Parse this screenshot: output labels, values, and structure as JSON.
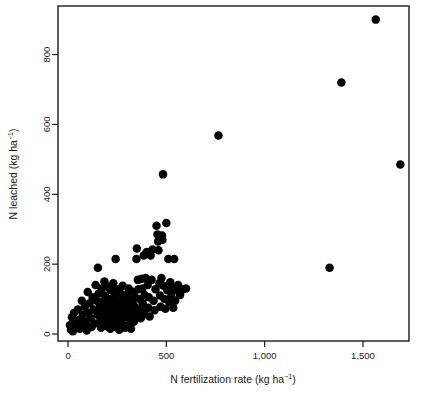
{
  "chart_data": {
    "type": "scatter",
    "title": "",
    "xlabel": "N fertilization rate (kg ha⁻¹)",
    "ylabel": "N leached (kg ha⁻¹)",
    "xlabel_parts": {
      "base": "N fertilization rate (kg ha",
      "exponent": "−1",
      "tail": ")"
    },
    "ylabel_parts": {
      "base": "N leached (kg ha",
      "exponent": "−1",
      "tail": ")"
    },
    "xlim": [
      -51,
      1734
    ],
    "ylim": [
      -20,
      939
    ],
    "xticks": [
      0,
      500,
      1000,
      1500
    ],
    "xticklabels": [
      "0",
      "500",
      "1,000",
      "1,500"
    ],
    "yticks": [
      0,
      200,
      400,
      600,
      800
    ],
    "yticklabels": [
      "0",
      "200",
      "400",
      "600",
      "800"
    ],
    "grid": false,
    "legend": false,
    "marker": "circle",
    "marker_color": "#000000",
    "marker_size_px": 8.5,
    "frame_color": "#1a1a1a",
    "background_color": "#ffffff",
    "series": [
      {
        "name": "N leached vs N fertilization rate",
        "points": [
          [
            10,
            25
          ],
          [
            15,
            12
          ],
          [
            20,
            48
          ],
          [
            25,
            8
          ],
          [
            30,
            60
          ],
          [
            40,
            30
          ],
          [
            45,
            18
          ],
          [
            50,
            70
          ],
          [
            55,
            40
          ],
          [
            60,
            15
          ],
          [
            70,
            95
          ],
          [
            75,
            55
          ],
          [
            80,
            22
          ],
          [
            85,
            78
          ],
          [
            90,
            35
          ],
          [
            95,
            10
          ],
          [
            100,
            120
          ],
          [
            105,
            60
          ],
          [
            110,
            88
          ],
          [
            115,
            45
          ],
          [
            120,
            20
          ],
          [
            125,
            105
          ],
          [
            130,
            70
          ],
          [
            135,
            30
          ],
          [
            140,
            140
          ],
          [
            145,
            95
          ],
          [
            150,
            55
          ],
          [
            152,
            190
          ],
          [
            155,
            115
          ],
          [
            160,
            75
          ],
          [
            165,
            40
          ],
          [
            168,
            18
          ],
          [
            170,
            130
          ],
          [
            175,
            92
          ],
          [
            178,
            62
          ],
          [
            180,
            35
          ],
          [
            185,
            150
          ],
          [
            188,
            110
          ],
          [
            190,
            80
          ],
          [
            195,
            50
          ],
          [
            198,
            22
          ],
          [
            200,
            135
          ],
          [
            205,
            100
          ],
          [
            208,
            68
          ],
          [
            210,
            42
          ],
          [
            215,
            15
          ],
          [
            218,
            125
          ],
          [
            220,
            88
          ],
          [
            225,
            58
          ],
          [
            228,
            30
          ],
          [
            230,
            145
          ],
          [
            235,
            108
          ],
          [
            238,
            75
          ],
          [
            240,
            45
          ],
          [
            242,
            215
          ],
          [
            245,
            20
          ],
          [
            248,
            128
          ],
          [
            250,
            95
          ],
          [
            255,
            65
          ],
          [
            258,
            38
          ],
          [
            260,
            12
          ],
          [
            265,
            118
          ],
          [
            268,
            85
          ],
          [
            270,
            55
          ],
          [
            275,
            28
          ],
          [
            278,
            138
          ],
          [
            280,
            102
          ],
          [
            285,
            72
          ],
          [
            288,
            48
          ],
          [
            290,
            18
          ],
          [
            295,
            112
          ],
          [
            298,
            80
          ],
          [
            300,
            52
          ],
          [
            305,
            25
          ],
          [
            308,
            130
          ],
          [
            310,
            98
          ],
          [
            315,
            68
          ],
          [
            318,
            42
          ],
          [
            320,
            15
          ],
          [
            325,
            122
          ],
          [
            328,
            90
          ],
          [
            330,
            60
          ],
          [
            335,
            35
          ],
          [
            338,
            108
          ],
          [
            340,
            78
          ],
          [
            345,
            50
          ],
          [
            348,
            215
          ],
          [
            350,
            245
          ],
          [
            355,
            155
          ],
          [
            358,
            128
          ],
          [
            360,
            62
          ],
          [
            365,
            100
          ],
          [
            368,
            72
          ],
          [
            370,
            45
          ],
          [
            375,
            158
          ],
          [
            378,
            130
          ],
          [
            380,
            88
          ],
          [
            385,
            225
          ],
          [
            388,
            58
          ],
          [
            390,
            112
          ],
          [
            395,
            160
          ],
          [
            400,
            235
          ],
          [
            405,
            140
          ],
          [
            408,
            75
          ],
          [
            410,
            105
          ],
          [
            415,
            50
          ],
          [
            420,
            225
          ],
          [
            425,
            155
          ],
          [
            430,
            242
          ],
          [
            435,
            95
          ],
          [
            440,
            68
          ],
          [
            445,
            128
          ],
          [
            450,
            310
          ],
          [
            455,
            285
          ],
          [
            458,
            265
          ],
          [
            460,
            240
          ],
          [
            465,
            145
          ],
          [
            468,
            110
          ],
          [
            470,
            78
          ],
          [
            475,
            160
          ],
          [
            478,
            282
          ],
          [
            480,
            270
          ],
          [
            483,
            457
          ],
          [
            485,
            138
          ],
          [
            490,
            100
          ],
          [
            495,
            72
          ],
          [
            500,
            318
          ],
          [
            505,
            125
          ],
          [
            510,
            215
          ],
          [
            515,
            92
          ],
          [
            520,
            148
          ],
          [
            525,
            108
          ],
          [
            530,
            130
          ],
          [
            535,
            75
          ],
          [
            540,
            215
          ],
          [
            545,
            95
          ],
          [
            550,
            125
          ],
          [
            560,
            140
          ],
          [
            570,
            112
          ],
          [
            585,
            128
          ],
          [
            600,
            130
          ],
          [
            765,
            568
          ],
          [
            1330,
            190
          ],
          [
            1390,
            720
          ],
          [
            1565,
            900
          ],
          [
            1690,
            485
          ]
        ]
      }
    ]
  }
}
